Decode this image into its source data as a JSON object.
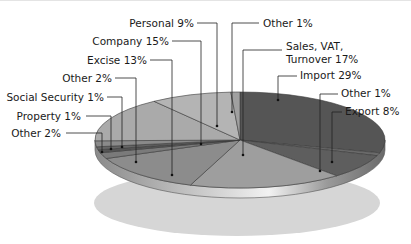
{
  "chart_data": {
    "type": "pie",
    "title": "",
    "style": "3d-pie",
    "categories": [
      "Import",
      "Other",
      "Export",
      "Sales, VAT, Turnover",
      "Excise",
      "Other",
      "Social Security",
      "Property",
      "Other",
      "Company",
      "Personal",
      "Other"
    ],
    "values": [
      29,
      1,
      8,
      17,
      13,
      2,
      1,
      1,
      2,
      15,
      9,
      1
    ],
    "unit": "%",
    "labels": [
      {
        "text": "Import 29%"
      },
      {
        "text": "Other 1%"
      },
      {
        "text": "Export 8%"
      },
      {
        "text": "Sales, VAT,",
        "text2": "Turnover 17%"
      },
      {
        "text": "Excise 13%"
      },
      {
        "text": "Other 2%"
      },
      {
        "text": "Social Security 1%"
      },
      {
        "text": "Property 1%"
      },
      {
        "text": "Other 2%"
      },
      {
        "text": "Company 15%"
      },
      {
        "text": "Personal 9%"
      },
      {
        "text": "Other 1%"
      }
    ],
    "colors": [
      "#555555",
      "#6a6a6a",
      "#5e5e5e",
      "#9e9e9e",
      "#8c8c8c",
      "#7a7a7a",
      "#555555",
      "#666666",
      "#8a8a8a",
      "#aaaaaa",
      "#b4b4b4",
      "#a0a0a0"
    ],
    "legend": "none (leader-line labels)"
  }
}
